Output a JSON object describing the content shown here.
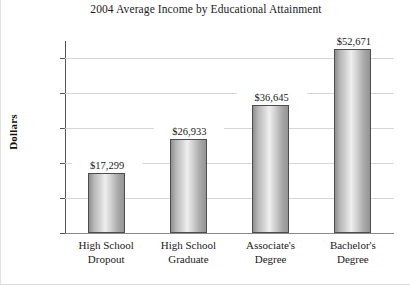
{
  "chart_data": {
    "type": "bar",
    "title": "2004 Average Income by Educational Attainment",
    "xlabel": "",
    "ylabel": "Dollars",
    "categories": [
      "High School Dropout",
      "High School Graduate",
      "Associate's Degree",
      "Bachelor's Degree"
    ],
    "category_lines": [
      [
        "High School",
        "Dropout"
      ],
      [
        "High School",
        "Graduate"
      ],
      [
        "Associate's",
        "Degree"
      ],
      [
        "Bachelor's",
        "Degree"
      ]
    ],
    "values": [
      17299,
      26933,
      36645,
      52671
    ],
    "value_labels": [
      "$17,299",
      "$26,933",
      "$36,645",
      "$52,671"
    ],
    "ylim": [
      0,
      55000
    ],
    "yticks": [
      0,
      10000,
      20000,
      30000,
      40000,
      50000
    ],
    "ytick_labels": [
      "0",
      "10,000",
      "20,000",
      "30,000",
      "40,000",
      "50,000"
    ],
    "grid": true,
    "legend": false,
    "bar_color": "#cfcfcf",
    "bar_edge_color": "#4d4d4d",
    "grid_color": "#d6d6d6",
    "axis_color": "#555555",
    "background": "#ffffff"
  }
}
